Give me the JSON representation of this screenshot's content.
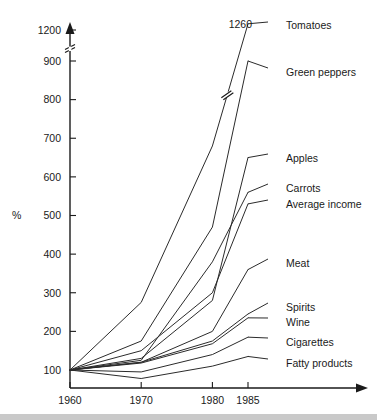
{
  "chart_data": {
    "type": "line",
    "title": "",
    "subtitle": "",
    "xlabel": "",
    "ylabel": "%",
    "x": [
      1960,
      1970,
      1980,
      1985
    ],
    "xtick_labels": [
      "1960",
      "1970",
      "1980",
      "1985"
    ],
    "ytick_labels": [
      "100",
      "200",
      "300",
      "400",
      "500",
      "600",
      "700",
      "800",
      "900",
      "1200"
    ],
    "ytick_values": [
      100,
      200,
      300,
      400,
      500,
      600,
      700,
      800,
      900,
      1200
    ],
    "ylim": [
      60,
      1280
    ],
    "grid": false,
    "legend_position": "right-inline-labels",
    "axis_break": {
      "present": true,
      "between": [
        900,
        1200
      ],
      "symbol": "double-slash"
    },
    "annotations": [
      {
        "text": "1260",
        "series": "Tomatoes",
        "x": 1985,
        "y": 1260
      }
    ],
    "series": [
      {
        "name": "Tomatoes",
        "label": "Tomatoes",
        "values": [
          100,
          275,
          680,
          1260
        ],
        "break_marker": true
      },
      {
        "name": "Green peppers",
        "label": "Green peppers",
        "values": [
          100,
          175,
          470,
          900
        ]
      },
      {
        "name": "Apples",
        "label": "Apples",
        "values": [
          100,
          130,
          280,
          650
        ]
      },
      {
        "name": "Carrots",
        "label": "Carrots",
        "values": [
          100,
          125,
          380,
          560
        ]
      },
      {
        "name": "Average income",
        "label": "Average income",
        "values": [
          100,
          150,
          300,
          530
        ]
      },
      {
        "name": "Meat",
        "label": "Meat",
        "values": [
          100,
          120,
          200,
          360
        ]
      },
      {
        "name": "Spirits",
        "label": "Spirits",
        "values": [
          100,
          120,
          175,
          245
        ]
      },
      {
        "name": "Wine",
        "label": "Wine",
        "values": [
          100,
          118,
          168,
          235
        ]
      },
      {
        "name": "Cigarettes",
        "label": "Cigarettes",
        "values": [
          100,
          95,
          140,
          185
        ]
      },
      {
        "name": "Fatty products",
        "label": "Fatty products",
        "values": [
          100,
          78,
          110,
          135
        ]
      }
    ]
  },
  "labels": {
    "percent": "%",
    "value_1260": "1260"
  }
}
